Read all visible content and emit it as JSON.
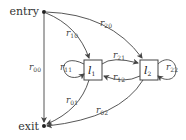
{
  "diagram": {
    "type": "state-transition-graph",
    "terminals": {
      "entry": {
        "label": "entry"
      },
      "exit": {
        "label": "exit"
      }
    },
    "nodes": [
      {
        "id": "l1",
        "label": "l",
        "sub": "1"
      },
      {
        "id": "l2",
        "label": "l",
        "sub": "2"
      }
    ],
    "edges": [
      {
        "id": "r00",
        "from": "entry",
        "to": "exit",
        "label": "r",
        "sub": "00"
      },
      {
        "id": "r10",
        "from": "entry",
        "to": "l1",
        "label": "r",
        "sub": "10"
      },
      {
        "id": "r20",
        "from": "entry",
        "to": "l2",
        "label": "r",
        "sub": "20"
      },
      {
        "id": "r11",
        "from": "l1",
        "to": "l1",
        "label": "r",
        "sub": "11"
      },
      {
        "id": "r21",
        "from": "l1",
        "to": "l2",
        "label": "r",
        "sub": "21"
      },
      {
        "id": "r12",
        "from": "l2",
        "to": "l1",
        "label": "r",
        "sub": "12"
      },
      {
        "id": "r22",
        "from": "l2",
        "to": "l2",
        "label": "r",
        "sub": "22"
      },
      {
        "id": "r01",
        "from": "l1",
        "to": "exit",
        "label": "r",
        "sub": "01"
      },
      {
        "id": "r02",
        "from": "l2",
        "to": "exit",
        "label": "r",
        "sub": "02"
      }
    ],
    "colors": {
      "stroke": "#444444",
      "text": "#333333",
      "background": "#ffffff"
    }
  }
}
